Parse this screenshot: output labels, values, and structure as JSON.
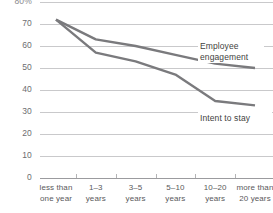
{
  "chart_data": {
    "type": "line",
    "title": "",
    "subtitle": "",
    "xlabel": "",
    "ylabel": "",
    "unit_label": "80%",
    "categories": [
      "less than\none year",
      "1–3\nyears",
      "3–5\nyears",
      "5–10\nyears",
      "10–20\nyears",
      "more than\n20 years"
    ],
    "yticks": [
      "80%",
      "70",
      "60",
      "50",
      "40",
      "30",
      "20",
      "10",
      "0"
    ],
    "ytick_values": [
      80,
      70,
      60,
      50,
      40,
      30,
      20,
      10,
      0
    ],
    "ylim": [
      0,
      80
    ],
    "grid": true,
    "legend_position": "inline-right",
    "series": [
      {
        "name": "Employee engagement",
        "color": "#7a7a7d",
        "values": [
          72,
          63,
          60,
          56,
          52,
          50
        ]
      },
      {
        "name": "Intent to stay",
        "color": "#7a7a7d",
        "values": [
          72,
          57,
          53,
          47,
          35,
          33
        ]
      }
    ],
    "annotations": [
      {
        "id": "engagement",
        "text": "Employee\nengagement"
      },
      {
        "id": "intent",
        "text": "Intent to stay"
      }
    ]
  },
  "colors": {
    "gridline": "#c9c9cb",
    "baseline": "#9b9b9e",
    "line": "#7a7a7d",
    "text": "#59595b",
    "background": "#ffffff"
  }
}
